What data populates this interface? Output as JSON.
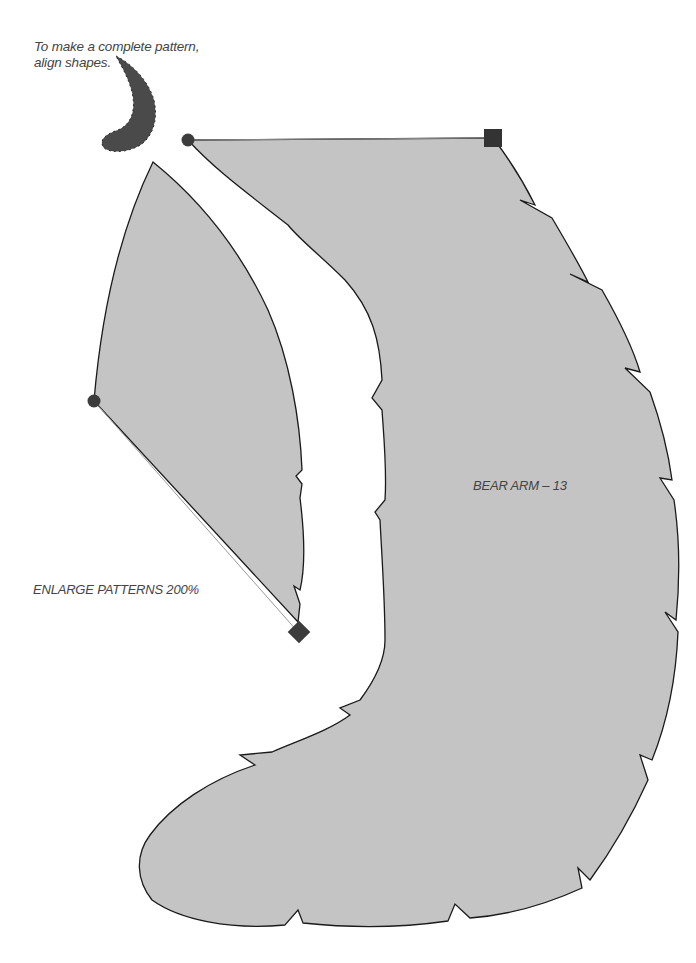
{
  "instructions": {
    "line1": "To make a complete pattern,",
    "line2": "align shapes."
  },
  "pattern": {
    "piece_label": "BEAR ARM – 13",
    "enlarge_note": "ENLARGE PATTERNS 200%"
  },
  "colors": {
    "piece_fill": "#c4c4c4",
    "outline": "#1a1a1a",
    "marker": "#3c3c3c",
    "crescent": "#4a4a4a",
    "background": "#ffffff"
  },
  "markers": {
    "circle_top": "circle-marker",
    "square_top": "square-marker",
    "circle_left": "circle-marker",
    "diamond_bottom": "diamond-marker"
  }
}
